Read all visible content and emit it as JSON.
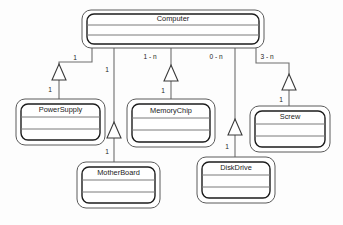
{
  "diagram": {
    "kind": "uml-class-diagram",
    "background_color": "#fdfdfd",
    "line_color": "#6e6e6e",
    "box_border_color": "#1d1d1d",
    "box_fill_color": "#ffffff",
    "text_color": "#1a1a1a"
  },
  "classes": {
    "computer": {
      "name": "Computer",
      "x": 82,
      "y": 10,
      "w": 182,
      "h": 38
    },
    "power_supply": {
      "name": "PowerSupply",
      "x": 16,
      "y": 99,
      "w": 89,
      "h": 46
    },
    "memory_chip": {
      "name": "MemoryChip",
      "x": 127,
      "y": 99,
      "w": 88,
      "h": 48
    },
    "screw": {
      "name": "Screw",
      "x": 250,
      "y": 106,
      "w": 80,
      "h": 46
    },
    "mother_board": {
      "name": "MotherBoard",
      "x": 77,
      "y": 162,
      "w": 83,
      "h": 46
    },
    "disk_drive": {
      "name": "DiskDrive",
      "x": 197,
      "y": 157,
      "w": 78,
      "h": 46
    }
  },
  "associations": [
    {
      "id": "computer-powersupply",
      "from": "Computer",
      "to": "PowerSupply",
      "source_multiplicity": "1",
      "target_multiplicity": "1"
    },
    {
      "id": "computer-motherboard",
      "from": "Computer",
      "to": "MotherBoard",
      "source_multiplicity": "1",
      "target_multiplicity": "1"
    },
    {
      "id": "computer-memorychip",
      "from": "Computer",
      "to": "MemoryChip",
      "source_multiplicity": "1 - n",
      "target_multiplicity": "1"
    },
    {
      "id": "computer-diskdrive",
      "from": "Computer",
      "to": "DiskDrive",
      "source_multiplicity": "0 - n",
      "target_multiplicity": "1"
    },
    {
      "id": "computer-screw",
      "from": "Computer",
      "to": "Screw",
      "source_multiplicity": "3 - n",
      "target_multiplicity": "1"
    }
  ],
  "labels": {
    "ps_top": "1",
    "ps_bottom": "1",
    "mb_top": "1",
    "mb_bottom": "1",
    "mc_top": "1 - n",
    "mc_bottom": "1",
    "dd_top": "0 - n",
    "dd_bottom": "1",
    "sc_top": "3 - n",
    "sc_bottom": "1"
  }
}
